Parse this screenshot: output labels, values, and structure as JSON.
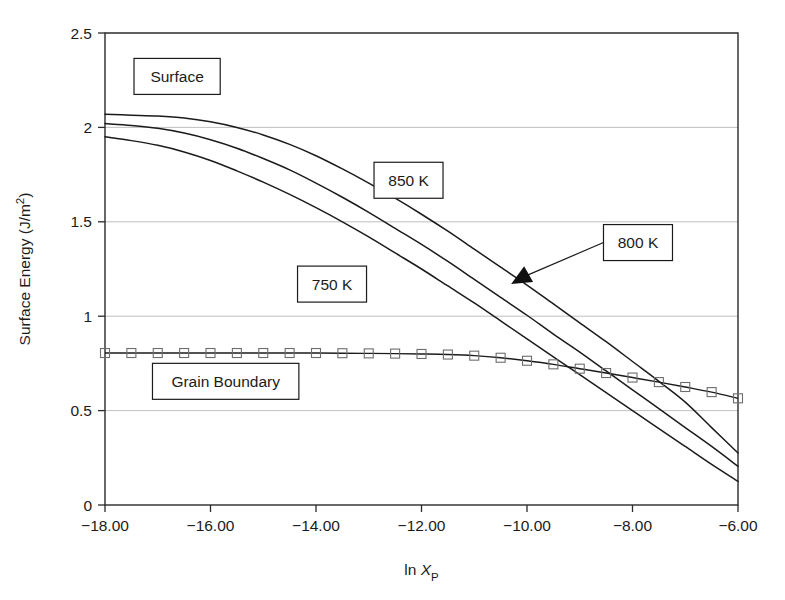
{
  "chart_data": {
    "type": "line",
    "title": "",
    "xlabel": "ln X_P",
    "ylabel": "Surface Energy (J/m2)",
    "xlim": [
      -18,
      -6
    ],
    "ylim": [
      0,
      2.5
    ],
    "xticks": [
      -18,
      -16,
      -14,
      -12,
      -10,
      -8,
      -6
    ],
    "xticklabels": [
      "−18.00",
      "−16.00",
      "−14.00",
      "−12.00",
      "−10.00",
      "−8.00",
      "−6.00"
    ],
    "yticks": [
      0,
      0.5,
      1,
      1.5,
      2,
      2.5
    ],
    "yticklabels": [
      "0",
      "0.5",
      "1",
      "1.5",
      "2",
      "2.5"
    ],
    "grid": "horizontal",
    "legend": "none",
    "series": [
      {
        "name": "850 K",
        "group": "Surface",
        "marker": "none",
        "x": [
          -18,
          -17.5,
          -17,
          -16.5,
          -16,
          -15.5,
          -15,
          -14.5,
          -14,
          -13.5,
          -13,
          -12.5,
          -12,
          -11.5,
          -11,
          -10.5,
          -10,
          -9.5,
          -9,
          -8.5,
          -8,
          -7.5,
          -7,
          -6.5,
          -6
        ],
        "y": [
          2.07,
          2.065,
          2.06,
          2.05,
          2.03,
          2.0,
          1.96,
          1.91,
          1.85,
          1.78,
          1.705,
          1.625,
          1.54,
          1.45,
          1.355,
          1.26,
          1.165,
          1.065,
          0.965,
          0.865,
          0.76,
          0.655,
          0.545,
          0.41,
          0.275
        ]
      },
      {
        "name": "800 K",
        "group": "Surface",
        "marker": "none",
        "x": [
          -18,
          -17.5,
          -17,
          -16.5,
          -16,
          -15.5,
          -15,
          -14.5,
          -14,
          -13.5,
          -13,
          -12.5,
          -12,
          -11.5,
          -11,
          -10.5,
          -10,
          -9.5,
          -9,
          -8.5,
          -8,
          -7.5,
          -7,
          -6.5,
          -6
        ],
        "y": [
          2.02,
          2.01,
          1.995,
          1.97,
          1.935,
          1.89,
          1.835,
          1.775,
          1.705,
          1.63,
          1.55,
          1.465,
          1.38,
          1.29,
          1.195,
          1.1,
          1.005,
          0.905,
          0.81,
          0.71,
          0.61,
          0.51,
          0.41,
          0.31,
          0.205
        ]
      },
      {
        "name": "750 K",
        "group": "Surface",
        "marker": "none",
        "x": [
          -18,
          -17.5,
          -17,
          -16.5,
          -16,
          -15.5,
          -15,
          -14.5,
          -14,
          -13.5,
          -13,
          -12.5,
          -12,
          -11.5,
          -11,
          -10.5,
          -10,
          -9.5,
          -9,
          -8.5,
          -8,
          -7.5,
          -7,
          -6.5,
          -6
        ],
        "y": [
          1.95,
          1.93,
          1.905,
          1.87,
          1.825,
          1.77,
          1.71,
          1.645,
          1.575,
          1.5,
          1.42,
          1.335,
          1.25,
          1.16,
          1.07,
          0.975,
          0.88,
          0.785,
          0.69,
          0.595,
          0.5,
          0.405,
          0.31,
          0.215,
          0.125
        ]
      },
      {
        "name": "Grain Boundary",
        "group": "Grain Boundary",
        "marker": "square",
        "x": [
          -18,
          -17.5,
          -17,
          -16.5,
          -16,
          -15.5,
          -15,
          -14.5,
          -14,
          -13.5,
          -13,
          -12.5,
          -12,
          -11.5,
          -11,
          -10.5,
          -10,
          -9.5,
          -9,
          -8.5,
          -8,
          -7.5,
          -7,
          -6.5,
          -6
        ],
        "y": [
          0.805,
          0.805,
          0.805,
          0.805,
          0.805,
          0.805,
          0.805,
          0.805,
          0.805,
          0.804,
          0.803,
          0.802,
          0.8,
          0.797,
          0.791,
          0.78,
          0.764,
          0.745,
          0.722,
          0.699,
          0.675,
          0.651,
          0.625,
          0.598,
          0.565
        ]
      }
    ],
    "annotations": [
      {
        "id": "surface",
        "text": "Surface",
        "x": -17.45,
        "y": 2.27,
        "style": "boxed"
      },
      {
        "id": "t850",
        "text": "850 K",
        "x": -12.9,
        "y": 1.72,
        "style": "boxed"
      },
      {
        "id": "t800",
        "text": "800 K",
        "x": -8.55,
        "y": 1.39,
        "style": "boxed",
        "arrow_to_x": -10.3,
        "arrow_to_y": 1.17
      },
      {
        "id": "t750",
        "text": "750 K",
        "x": -14.35,
        "y": 1.17,
        "style": "boxed"
      },
      {
        "id": "grain_boundary",
        "text": "Grain Boundary",
        "x": -17.1,
        "y": 0.655,
        "style": "boxed"
      }
    ]
  }
}
